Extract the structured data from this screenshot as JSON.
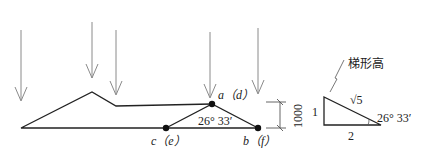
{
  "diagram": {
    "point_labels": {
      "a": "a（d）",
      "c": "c（e）",
      "b": "b（f）"
    },
    "angle_label": "26° 33′",
    "dimension_label": "1000",
    "triangle": {
      "callout": "梯形高",
      "hyp_label": "√5",
      "vertical_label": "1",
      "horizontal_label": "2",
      "angle_label": "26° 33′"
    },
    "colors": {
      "line": "#222222",
      "arrow": "#888888",
      "dimension": "#555555"
    }
  }
}
